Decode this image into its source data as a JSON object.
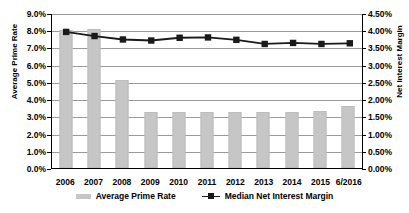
{
  "chart_data": {
    "type": "bar",
    "title": "",
    "categories": [
      "2006",
      "2007",
      "2008",
      "2009",
      "2010",
      "2011",
      "2012",
      "2013",
      "2014",
      "2015",
      "6/2016"
    ],
    "series": [
      {
        "name": "Average Prime Rate",
        "axis": "left",
        "render": "bar",
        "color": "#c6c6c6",
        "values": [
          8.0,
          8.05,
          5.1,
          3.25,
          3.25,
          3.25,
          3.25,
          3.25,
          3.28,
          3.32,
          3.6
        ]
      },
      {
        "name": "Median Net Interest Margin",
        "axis": "right",
        "render": "line",
        "color": "#1a1a1a",
        "values": [
          3.98,
          3.86,
          3.76,
          3.73,
          3.81,
          3.82,
          3.75,
          3.63,
          3.66,
          3.63,
          3.65
        ]
      }
    ],
    "xlabel": "",
    "ylabel": "Average Prime Rate",
    "y2label": "Net Interest Margin",
    "ylim": [
      0,
      9
    ],
    "y2lim": [
      0,
      4.5
    ],
    "ytick_labels": [
      "9.0%",
      "8.0%",
      "7.0%",
      "6.0%",
      "5.0%",
      "4.0%",
      "3.0%",
      "2.0%",
      "1.0%",
      "0.0%"
    ],
    "ytick_values": [
      9,
      8,
      7,
      6,
      5,
      4,
      3,
      2,
      1,
      0
    ],
    "y2tick_labels": [
      "4.50%",
      "4.00%",
      "3.50%",
      "3.00%",
      "2.50%",
      "2.00%",
      "1.50%",
      "1.00%",
      "0.50%",
      "0.00%"
    ],
    "y2tick_values": [
      4.5,
      4.0,
      3.5,
      3.0,
      2.5,
      2.0,
      1.5,
      1.0,
      0.5,
      0.0
    ],
    "grid": true,
    "legend_position": "bottom",
    "legend": [
      "Average Prime Rate",
      "Median Net Interest Margin"
    ]
  },
  "axes": {
    "left_title": "Average Prime Rate",
    "right_title": "Net Interest Margin"
  }
}
